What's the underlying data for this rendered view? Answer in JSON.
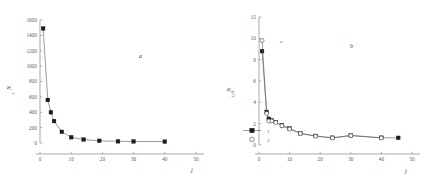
{
  "figure": {
    "background": "#ffffff",
    "line_color": "#4a4a4a",
    "marker_filled_color": "#1c1c1c",
    "marker_open_color": "#ffffff"
  },
  "panel_a": {
    "label": "a",
    "ylabel_main": "N",
    "ylabel_sub": "j",
    "xlabel_main": "j",
    "chart_data": {
      "type": "scatter",
      "title": "a",
      "xlabel": "j",
      "ylabel": "N_j",
      "xlim": [
        0,
        50
      ],
      "ylim": [
        0,
        1600
      ],
      "xticks": [
        0,
        10,
        20,
        30,
        40,
        50
      ],
      "yticks": [
        0,
        200,
        400,
        600,
        800,
        1000,
        1200,
        1400,
        1600
      ],
      "grid": false,
      "legend": "none",
      "series": [
        {
          "name": "1",
          "marker": "filled-square",
          "x": [
            1,
            2.5,
            3.5,
            4.5,
            7,
            10,
            14,
            19,
            25,
            30,
            40
          ],
          "y": [
            1490,
            560,
            400,
            285,
            145,
            75,
            45,
            28,
            22,
            20,
            18
          ]
        }
      ]
    }
  },
  "panel_b": {
    "label": "b",
    "ylabel_main": "N",
    "ylabel_sub": "j,i,k",
    "xlabel_main": "j",
    "annotation_circle": "o",
    "legend": {
      "entries": [
        {
          "label": "1",
          "marker": "filled-square"
        },
        {
          "label": "2",
          "marker": "open-circle"
        }
      ]
    },
    "chart_data": {
      "type": "scatter",
      "title": "b",
      "xlabel": "j",
      "ylabel": "N_j,i,k",
      "xlim": [
        0,
        50
      ],
      "ylim": [
        0,
        12
      ],
      "xticks": [
        0,
        10,
        20,
        30,
        40,
        50
      ],
      "yticks": [
        0,
        2,
        4,
        6,
        8,
        10,
        12
      ],
      "grid": false,
      "legend": "lower-left",
      "series": [
        {
          "name": "1",
          "marker": "filled-square",
          "x": [
            1,
            2.5,
            3.2,
            4.2,
            5.5,
            7.5,
            10,
            13.5,
            18.5,
            24,
            30,
            40,
            45.5
          ],
          "y": [
            8.8,
            3.1,
            2.45,
            2.3,
            2.15,
            1.85,
            1.55,
            1.1,
            0.85,
            0.68,
            0.9,
            0.68,
            0.67
          ]
        },
        {
          "name": "2",
          "marker": "open-circle",
          "x": [
            1,
            2.5,
            3.2,
            4.2,
            5.5,
            7.5,
            10,
            13.5,
            18.5,
            24,
            30,
            40
          ],
          "y": [
            9.8,
            2.95,
            2.25,
            2.25,
            2.1,
            1.8,
            1.5,
            1.08,
            0.82,
            0.66,
            0.88,
            0.66
          ]
        }
      ]
    }
  }
}
